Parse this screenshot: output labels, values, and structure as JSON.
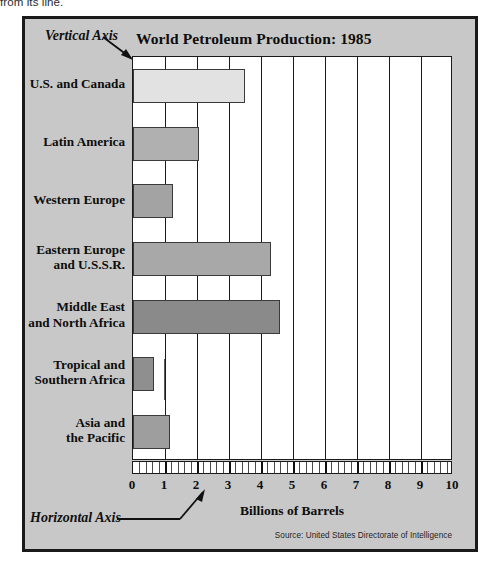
{
  "page": {
    "scrap_text": "from its line."
  },
  "figure": {
    "frame_bg": "#c8c8c8",
    "border_color": "#1a1a1a"
  },
  "annotations": [
    {
      "id": "vertical-axis",
      "label": "Vertical Axis"
    },
    {
      "id": "horizontal-axis",
      "label": "Horizontal Axis"
    }
  ],
  "source": {
    "text": "Source: United States Directorate of Intelligence"
  },
  "chart_data": {
    "type": "bar",
    "orientation": "horizontal",
    "title": "World Petroleum Production: 1985",
    "xlabel": "Billions of Barrels",
    "ylabel": "",
    "xlim": [
      0,
      10
    ],
    "xticks": [
      0,
      1,
      2,
      3,
      4,
      5,
      6,
      7,
      8,
      9,
      10
    ],
    "xtick_labels": [
      "0",
      "1",
      "2",
      "3",
      "4",
      "5",
      "6",
      "7",
      "8",
      "9",
      "10"
    ],
    "minor_ticks_per_unit": 5,
    "grid": "vertical",
    "legend": "none",
    "categories": [
      "U.S. and Canada",
      "Latin America",
      "Western Europe",
      "Eastern Europe and U.S.S.R.",
      "Middle East and North Africa",
      "Tropical and Southern Africa",
      "Asia and the Pacific"
    ],
    "category_lines": [
      [
        "U.S. and Canada"
      ],
      [
        "Latin America"
      ],
      [
        "Western Europe"
      ],
      [
        "Eastern Europe",
        "and U.S.S.R."
      ],
      [
        "Middle East",
        "and North Africa"
      ],
      [
        "Tropical and",
        "Southern Africa"
      ],
      [
        "Asia and",
        "the Pacific"
      ]
    ],
    "values": [
      3.5,
      2.05,
      1.25,
      4.3,
      4.6,
      0.65,
      1.15
    ],
    "bar_colors": [
      "#e2e2e2",
      "#b0b0b0",
      "#a3a3a3",
      "#a8a8a8",
      "#8a8a8a",
      "#8f8f8f",
      "#9e9e9e"
    ],
    "bar_border_color": "#3a3a3a"
  }
}
